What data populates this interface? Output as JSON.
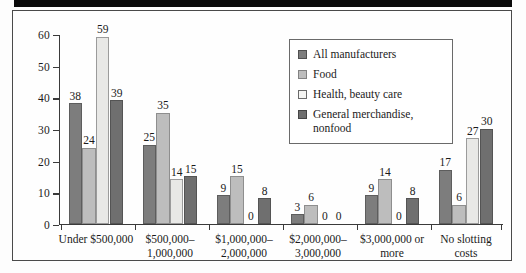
{
  "chart_data": {
    "type": "bar",
    "title": "",
    "subtitle": "",
    "xlabel": "",
    "ylabel": "",
    "ylim": [
      0,
      60
    ],
    "yticks": [
      0,
      10,
      20,
      30,
      40,
      50,
      60
    ],
    "grid": false,
    "legend_position": "inside-top-right",
    "categories": [
      "Under $500,000",
      "$500,000–\n1,000,000",
      "$1,000,000–\n2,000,000",
      "$2,000,000–\n3,000,000",
      "$3,000,000 or\nmore",
      "No slotting\ncosts"
    ],
    "category_lines": [
      [
        "Under $500,000"
      ],
      [
        "$500,000–",
        "1,000,000"
      ],
      [
        "$1,000,000–",
        "2,000,000"
      ],
      [
        "$2,000,000–",
        "3,000,000"
      ],
      [
        "$3,000,000 or",
        "more"
      ],
      [
        "No slotting",
        "costs"
      ]
    ],
    "series": [
      {
        "name": "All manufacturers",
        "color": "#7d7d7d",
        "values": [
          38,
          25,
          9,
          3,
          9,
          17
        ]
      },
      {
        "name": "Food",
        "color": "#bdbdbd",
        "values": [
          24,
          35,
          15,
          6,
          14,
          6
        ]
      },
      {
        "name": "Health, beauty care",
        "color": "#e8e8e6",
        "values": [
          59,
          14,
          0,
          0,
          0,
          27
        ]
      },
      {
        "name": "General merchandise, nonfood",
        "color": "#6f6f6f",
        "values": [
          39,
          15,
          8,
          0,
          8,
          30
        ]
      }
    ]
  },
  "legend": {
    "entries": [
      {
        "label": "All manufacturers"
      },
      {
        "label": "Food"
      },
      {
        "label": "Health, beauty care"
      },
      {
        "label": "General merchandise,"
      },
      {
        "label": "nonfood"
      }
    ]
  }
}
